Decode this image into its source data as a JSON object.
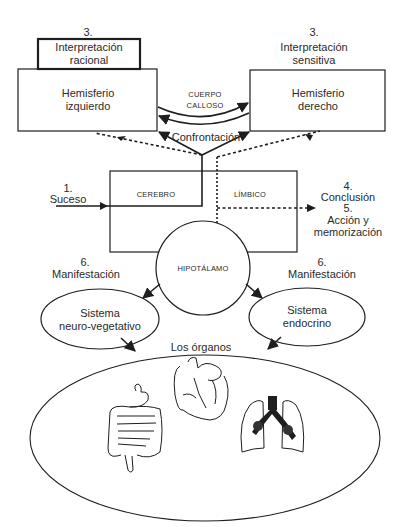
{
  "diagram": {
    "steps": {
      "step3_left_num": "3.",
      "step3_left_text": [
        "Interpretación",
        "racional"
      ],
      "step3_right_num": "3.",
      "step3_right_text": [
        "Interpretación",
        "sensitiva"
      ],
      "step1_num": "1.",
      "step1_text": "Suceso",
      "step4_num": "4.",
      "step4_text": "Conclusión",
      "step5_num": "5.",
      "step5_text": [
        "Acción y",
        "memorización"
      ],
      "step6_left_num": "6.",
      "step6_left_text": "Manifestación",
      "step6_right_num": "6.",
      "step6_right_text": "Manifestación"
    },
    "nodes": {
      "left_hemisphere": [
        "Hemisferio",
        "izquierdo"
      ],
      "right_hemisphere": [
        "Hemisferio",
        "derecho"
      ],
      "corpus_callosum": [
        "CUERPO",
        "CALLOSO"
      ],
      "confrontation": "Confrontación",
      "brain": "CEREBRO",
      "limbic": "LÍMBICO",
      "hypothalamus": "HIPOTÁLAMO",
      "neurovegetative": [
        "Sistema",
        "neuro-vegetativo"
      ],
      "endocrine": [
        "Sistema",
        "endocrino"
      ],
      "organs": "Los órganos"
    },
    "organ_icons": [
      "intestines-icon",
      "heart-icon",
      "lungs-icon"
    ],
    "colors": {
      "line": "#1e1e1e",
      "text": "#2a2a2a",
      "background": "#ffffff"
    }
  }
}
